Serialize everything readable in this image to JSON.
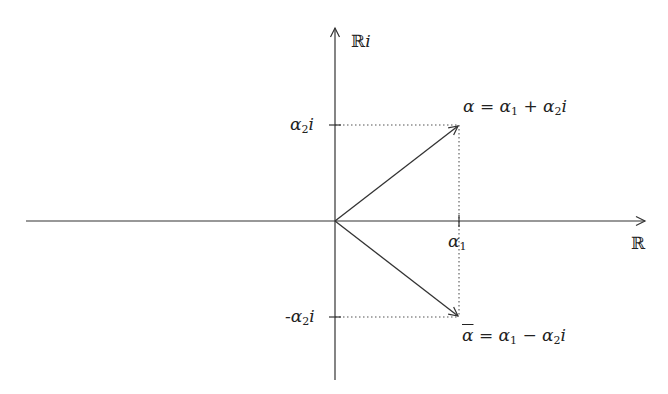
{
  "diagram": {
    "colors": {
      "axis": "#333333",
      "vector": "#333333",
      "guide": "#555555",
      "text": "#222222",
      "background": "#ffffff"
    },
    "axes": {
      "real": {
        "label": "ℝ"
      },
      "imaginary": {
        "label_main": "ℝ",
        "label_suffix": "i"
      }
    },
    "ticks": {
      "real_tick": {
        "base": "α",
        "sub": "1"
      },
      "imag_pos_tick": {
        "base": "α",
        "sub": "2",
        "suffix": "i"
      },
      "imag_neg_tick": {
        "prefix": "-",
        "base": "α",
        "sub": "2",
        "suffix": "i"
      }
    },
    "points": {
      "alpha": {
        "lhs": "α",
        "eq": " = ",
        "t1_base": "α",
        "t1_sub": "1",
        "op": " + ",
        "t2_base": "α",
        "t2_sub": "2",
        "t2_suffix": "i"
      },
      "alpha_conj": {
        "lhs": "α",
        "eq": " = ",
        "t1_base": "α",
        "t1_sub": "1",
        "op": " − ",
        "t2_base": "α",
        "t2_sub": "2",
        "t2_suffix": "i"
      }
    },
    "geometry": {
      "origin": [
        335,
        221
      ],
      "x_axis": {
        "from": [
          26,
          221
        ],
        "to": [
          645,
          221
        ]
      },
      "y_axis": {
        "from": [
          335,
          380
        ],
        "to": [
          335,
          28
        ]
      },
      "alpha_tip": [
        459,
        125
      ],
      "alpha_conj_tip": [
        459,
        317
      ]
    }
  }
}
